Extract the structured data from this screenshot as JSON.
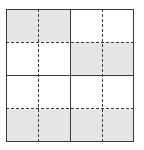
{
  "diagram": {
    "rows": 4,
    "cols": 4,
    "shade_color": "#e6e6e6",
    "line_color": "#3a3a3a",
    "shaded_cells": [
      [
        0,
        0
      ],
      [
        0,
        1
      ],
      [
        1,
        2
      ],
      [
        1,
        3
      ],
      [
        3,
        0
      ],
      [
        3,
        1
      ],
      [
        3,
        2
      ],
      [
        3,
        3
      ]
    ],
    "solid_lines": {
      "vertical_at_col": [
        2
      ],
      "horizontal_at_row": [
        2
      ]
    },
    "dashed_lines": {
      "vertical_at_col": [
        1,
        3
      ],
      "horizontal_at_row": [
        1,
        3
      ]
    }
  }
}
